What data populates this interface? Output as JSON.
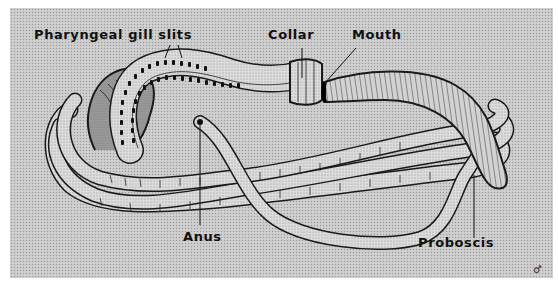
{
  "diagram": {
    "colors": {
      "background_stipple": "#c9c9c9",
      "body_fill": "#d8d8d8",
      "outline": "#1a1a1a",
      "gill_slit": "#111111",
      "label_text": "#111111"
    },
    "labels": {
      "gill_slits": "Pharyngeal gill slits",
      "collar": "Collar",
      "mouth": "Mouth",
      "anus": "Anus",
      "proboscis": "Proboscis"
    },
    "signature": "♂"
  }
}
